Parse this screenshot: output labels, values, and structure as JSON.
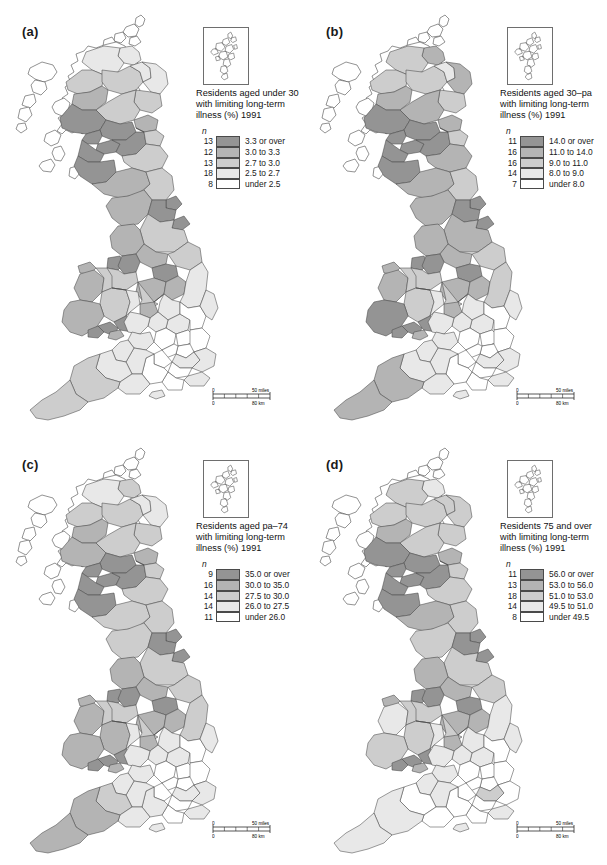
{
  "figure": {
    "type": "choropleth-map-grid",
    "rows": 2,
    "cols": 2,
    "region": "Great Britain (counties / local authority districts)",
    "background": "#ffffff"
  },
  "palette": {
    "class1": "#949494",
    "class2": "#b4b4b4",
    "class3": "#cdcdcd",
    "class4": "#e8e8e8",
    "class5": "#ffffff",
    "outline": "#4a4a4a",
    "text": "#1a1a1a"
  },
  "scalebar": {
    "miles_zero": "0",
    "miles_max": "50 miles",
    "km_zero": "0",
    "km_max": "80 km"
  },
  "panels": [
    {
      "label": "(a)",
      "title": "Residents aged under 30\nwith limiting long-term\nillness (%) 1991",
      "n_header": "n",
      "classes": [
        {
          "n": "13",
          "range": "3.3 or over",
          "color": "#949494"
        },
        {
          "n": "12",
          "range": "3.0 to 3.3",
          "color": "#b4b4b4"
        },
        {
          "n": "13",
          "range": "2.7 to 3.0",
          "color": "#cdcdcd"
        },
        {
          "n": "18",
          "range": "2.5 to 2.7",
          "color": "#e8e8e8"
        },
        {
          "n": "8",
          "range": "under 2.5",
          "color": "#ffffff"
        }
      ]
    },
    {
      "label": "(b)",
      "title": "Residents aged 30–pa\nwith limiting long-term\nillness (%) 1991",
      "n_header": "n",
      "classes": [
        {
          "n": "11",
          "range": "14.0 or over",
          "color": "#949494"
        },
        {
          "n": "16",
          "range": "11.0 to 14.0",
          "color": "#b4b4b4"
        },
        {
          "n": "16",
          "range": "9.0 to 11.0",
          "color": "#cdcdcd"
        },
        {
          "n": "14",
          "range": "8.0 to 9.0",
          "color": "#e8e8e8"
        },
        {
          "n": "7",
          "range": "under 8.0",
          "color": "#ffffff"
        }
      ]
    },
    {
      "label": "(c)",
      "title": "Residents aged pa–74\nwith limiting long-term\nillness (%)  1991",
      "n_header": "n",
      "classes": [
        {
          "n": "9",
          "range": "35.0 or over",
          "color": "#949494"
        },
        {
          "n": "16",
          "range": "30.0 to 35.0",
          "color": "#b4b4b4"
        },
        {
          "n": "14",
          "range": "27.5 to 30.0",
          "color": "#cdcdcd"
        },
        {
          "n": "14",
          "range": "26.0 to 27.5",
          "color": "#e8e8e8"
        },
        {
          "n": "11",
          "range": "under 26.0",
          "color": "#ffffff"
        }
      ]
    },
    {
      "label": "(d)",
      "title": "Residents 75 and over\nwith limiting long-term\nillness (%) 1991",
      "n_header": "n",
      "classes": [
        {
          "n": "11",
          "range": "56.0 or over",
          "color": "#949494"
        },
        {
          "n": "13",
          "range": "53.0 to 56.0",
          "color": "#b4b4b4"
        },
        {
          "n": "18",
          "range": "51.0 to 53.0",
          "color": "#cdcdcd"
        },
        {
          "n": "14",
          "range": "49.5 to 51.0",
          "color": "#e8e8e8"
        },
        {
          "n": "8",
          "range": "under 49.5",
          "color": "#ffffff"
        }
      ]
    }
  ]
}
